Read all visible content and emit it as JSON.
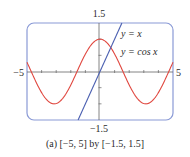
{
  "chart_data": {
    "type": "line",
    "title": "",
    "caption": "(a) [−5, 5] by [−1.5, 1.5]",
    "xlabel": "",
    "ylabel": "",
    "xlim": [
      -5,
      5
    ],
    "ylim": [
      -1.5,
      1.5
    ],
    "x_tick_labels": [
      "−5",
      "5"
    ],
    "y_tick_labels": [
      "1.5",
      "−1.5"
    ],
    "x_tick_step": 1,
    "y_tick_step": 0.5,
    "grid": false,
    "legend_position": "upper-right (inline annotations)",
    "series": [
      {
        "name": "y = x",
        "expression": "x",
        "color": "#4a5fb0",
        "x": [
          -1.5,
          1.5
        ],
        "y": [
          -1.5,
          1.5
        ]
      },
      {
        "name": "y = cos x",
        "expression": "cos(x)",
        "color": "#e0473f",
        "x": [
          -5,
          -4,
          -3.14,
          -2,
          -1,
          0,
          1,
          2,
          3.14,
          4,
          5
        ],
        "y": [
          0.284,
          -0.654,
          -1,
          -0.416,
          0.54,
          1,
          0.54,
          -0.416,
          -1,
          -0.654,
          0.284
        ]
      }
    ]
  },
  "labels": {
    "ymax": "1.5",
    "ymin": "−1.5",
    "xmin": "−5",
    "xmax": "5",
    "legend_line": "y = x",
    "legend_cos": "y = cos x",
    "caption": "(a) [−5, 5] by [−1.5, 1.5]"
  },
  "colors": {
    "frame": "#8a9ad6",
    "axis": "#555555",
    "line": "#4a5fb0",
    "cos": "#e0473f"
  }
}
